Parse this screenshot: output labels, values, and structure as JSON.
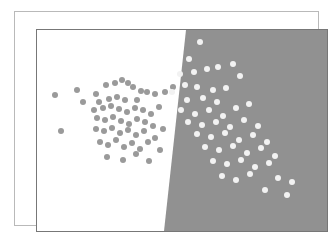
{
  "figure": {
    "title": "",
    "width": 333,
    "height": 239,
    "background_color": "#ffffff"
  },
  "frame": {
    "outer_border_color": "#b9b9b9",
    "inner_border_color": "#777777",
    "outer": {
      "x": 14,
      "y": 11,
      "w": 305,
      "h": 215
    },
    "inner": {
      "x": 21,
      "y": 17,
      "w": 292,
      "h": 203
    }
  },
  "chart_data": {
    "type": "scatter",
    "title": "",
    "subtitle": "",
    "xlabel": "",
    "ylabel": "",
    "xlim": [
      0,
      290
    ],
    "ylim": [
      0,
      201
    ],
    "grid": false,
    "legend_position": "none",
    "axis_ticks_visible": false,
    "tick_labels_x": [],
    "tick_labels_y": [],
    "annotations": [],
    "decision_regions": [
      {
        "name": "region-class-a",
        "label": "Class A region",
        "fill_color": "#ffffff",
        "side": "left"
      },
      {
        "name": "region-class-b",
        "label": "Class B region",
        "fill_color": "#919191",
        "side": "right"
      }
    ],
    "decision_boundary": {
      "type": "linear",
      "description": "near-vertical line sloping left as y increases",
      "points": [
        [
          149,
          0
        ],
        [
          127,
          201
        ]
      ],
      "color": "#919191"
    },
    "series": [
      {
        "name": "Class A",
        "marker": "circle",
        "marker_color": "#9a9a9a",
        "marker_size": 3.4,
        "count": 58,
        "points": [
          [
            18,
            65
          ],
          [
            40,
            60
          ],
          [
            46,
            72
          ],
          [
            24,
            101
          ],
          [
            59,
            64
          ],
          [
            69,
            55
          ],
          [
            78,
            53
          ],
          [
            85,
            50
          ],
          [
            91,
            53
          ],
          [
            96,
            57
          ],
          [
            104,
            61
          ],
          [
            62,
            72
          ],
          [
            72,
            69
          ],
          [
            80,
            67
          ],
          [
            88,
            70
          ],
          [
            100,
            70
          ],
          [
            110,
            62
          ],
          [
            118,
            64
          ],
          [
            128,
            62
          ],
          [
            136,
            57
          ],
          [
            57,
            80
          ],
          [
            66,
            78
          ],
          [
            74,
            76
          ],
          [
            82,
            79
          ],
          [
            90,
            82
          ],
          [
            98,
            78
          ],
          [
            106,
            80
          ],
          [
            114,
            84
          ],
          [
            122,
            77
          ],
          [
            60,
            88
          ],
          [
            68,
            90
          ],
          [
            76,
            87
          ],
          [
            84,
            91
          ],
          [
            92,
            94
          ],
          [
            100,
            89
          ],
          [
            108,
            92
          ],
          [
            116,
            96
          ],
          [
            59,
            99
          ],
          [
            67,
            101
          ],
          [
            75,
            98
          ],
          [
            83,
            103
          ],
          [
            91,
            100
          ],
          [
            99,
            105
          ],
          [
            107,
            101
          ],
          [
            118,
            108
          ],
          [
            126,
            99
          ],
          [
            63,
            112
          ],
          [
            71,
            115
          ],
          [
            79,
            110
          ],
          [
            87,
            117
          ],
          [
            95,
            113
          ],
          [
            103,
            119
          ],
          [
            111,
            112
          ],
          [
            123,
            120
          ],
          [
            70,
            127
          ],
          [
            86,
            130
          ],
          [
            99,
            124
          ],
          [
            112,
            131
          ]
        ]
      },
      {
        "name": "Class B",
        "marker": "circle",
        "marker_color": "#f2f2f2",
        "marker_size": 3.4,
        "count": 52,
        "points": [
          [
            163,
            12
          ],
          [
            152,
            29
          ],
          [
            157,
            42
          ],
          [
            143,
            44
          ],
          [
            170,
            39
          ],
          [
            181,
            37
          ],
          [
            196,
            34
          ],
          [
            148,
            55
          ],
          [
            160,
            57
          ],
          [
            176,
            60
          ],
          [
            189,
            58
          ],
          [
            135,
            62
          ],
          [
            150,
            70
          ],
          [
            166,
            68
          ],
          [
            180,
            72
          ],
          [
            203,
            46
          ],
          [
            144,
            80
          ],
          [
            158,
            84
          ],
          [
            172,
            80
          ],
          [
            186,
            86
          ],
          [
            199,
            78
          ],
          [
            212,
            74
          ],
          [
            151,
            92
          ],
          [
            165,
            95
          ],
          [
            179,
            92
          ],
          [
            193,
            97
          ],
          [
            207,
            90
          ],
          [
            221,
            96
          ],
          [
            160,
            104
          ],
          [
            174,
            107
          ],
          [
            188,
            103
          ],
          [
            202,
            110
          ],
          [
            216,
            105
          ],
          [
            230,
            112
          ],
          [
            168,
            117
          ],
          [
            182,
            120
          ],
          [
            196,
            116
          ],
          [
            210,
            123
          ],
          [
            224,
            118
          ],
          [
            238,
            126
          ],
          [
            176,
            131
          ],
          [
            190,
            134
          ],
          [
            204,
            130
          ],
          [
            218,
            137
          ],
          [
            232,
            133
          ],
          [
            185,
            146
          ],
          [
            199,
            150
          ],
          [
            213,
            144
          ],
          [
            241,
            148
          ],
          [
            255,
            152
          ],
          [
            228,
            160
          ],
          [
            250,
            165
          ]
        ]
      }
    ]
  }
}
